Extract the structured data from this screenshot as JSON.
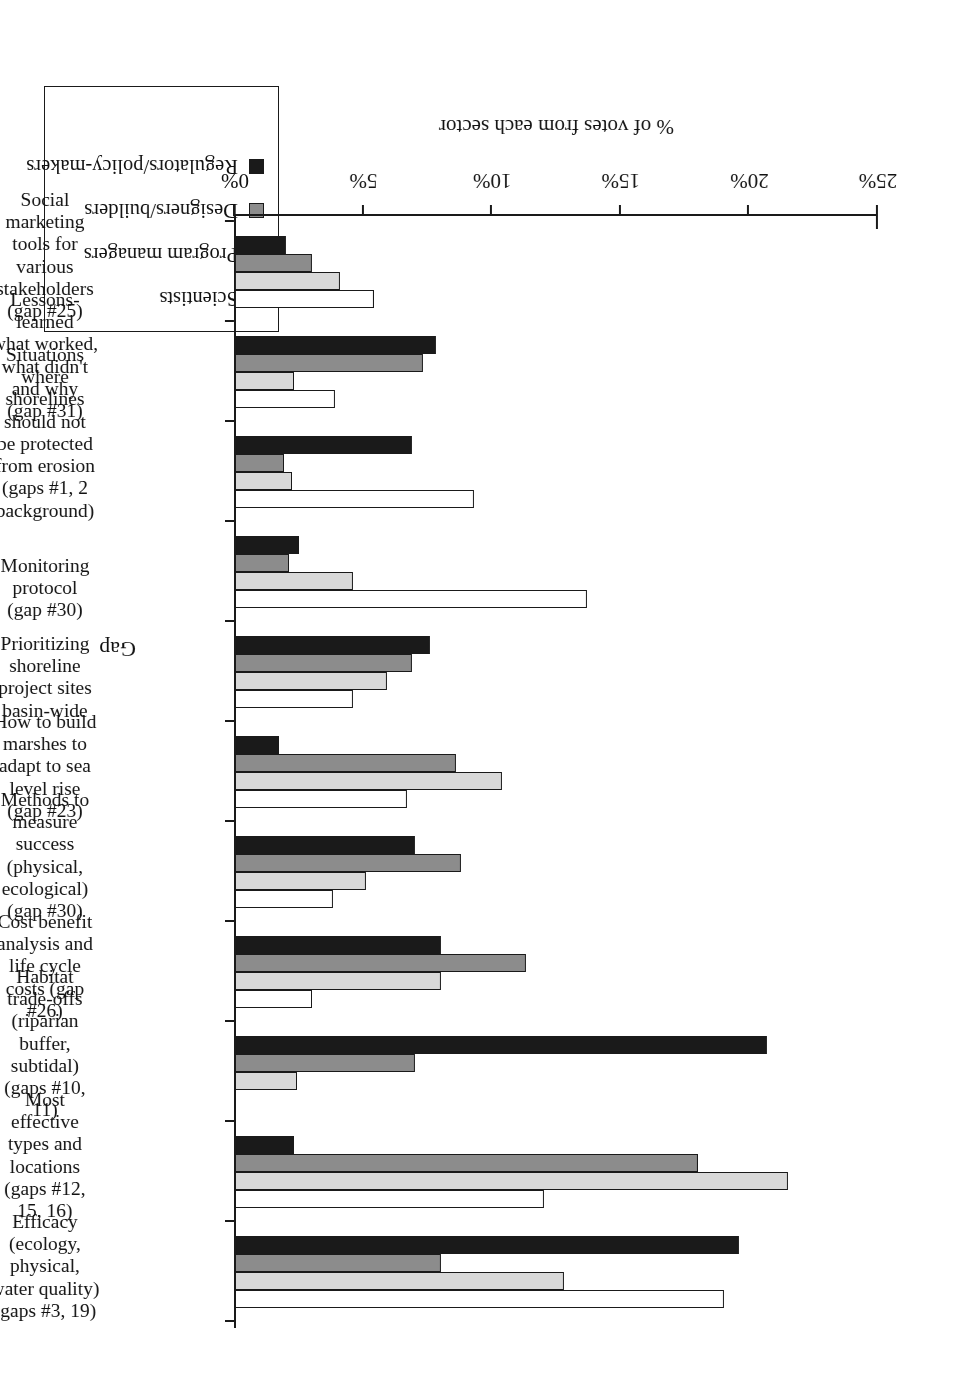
{
  "chart_data": {
    "type": "bar",
    "orientation": "vertical-grouped-rotated-180",
    "title": "",
    "xlabel": "Gap",
    "ylabel": "% of votes from each sector",
    "ylim": [
      0,
      25
    ],
    "yticks": [
      "0%",
      "5%",
      "10%",
      "15%",
      "20%",
      "25%"
    ],
    "ytick_values": [
      0,
      5,
      10,
      15,
      20,
      25
    ],
    "grid": false,
    "legend_position": "top-left",
    "categories": [
      "Efficacy (ecology, physical, water quality) (gaps #3, 19)",
      "Most effective types and locations (gaps #12, 15, 16)",
      "Habitat trade-offs (riparian buffer, subtidal) (gaps #10, 11)",
      "Cost benefit analysis and life cycle costs (gap #26)",
      "Methods to measure success (physical, ecological) (gap #30)",
      "How to build marshes to adapt to sea level rise (gap #23)",
      "Prioritizing shoreline project sites basin-wide",
      "Monitoring protocol (gap #30)",
      "Situations where shorelines should not be protected from erosion (gaps #1, 2 background)",
      "Lessons-learned what worked, what didn't and why (gap #31)",
      "Social marketing tools for various stakeholders (gap #25)"
    ],
    "category_lines": [
      [
        "Efficacy",
        "(ecology,",
        "physical,",
        "water quality)",
        "(gaps #3, 19)"
      ],
      [
        "Most",
        "effective",
        "types and",
        "locations",
        "(gaps #12,",
        "15, 16)"
      ],
      [
        "Habitat",
        "trade-offs",
        "(riparian",
        "buffer,",
        "subtidal)",
        "(gaps #10,",
        "11)"
      ],
      [
        "Cost benefit",
        "analysis and",
        "life cycle",
        "costs (gap",
        "#26)"
      ],
      [
        "Methods to",
        "measure",
        "success",
        "(physical,",
        "ecological)",
        "(gap #30)"
      ],
      [
        "How to build",
        "marshes to",
        "adapt to sea",
        "level rise",
        "(gap #23)"
      ],
      [
        "Prioritizing",
        "shoreline",
        "project sites",
        "basin-wide"
      ],
      [
        "Monitoring",
        "protocol",
        "(gap #30)"
      ],
      [
        "Situations",
        "where",
        "shorelines",
        "should not",
        "be protected",
        "from erosion",
        "(gaps #1, 2",
        "background)"
      ],
      [
        "Lessons-",
        "learned",
        "what worked,",
        "what didn't",
        "and why",
        "(gap #31)"
      ],
      [
        "Social",
        "marketing",
        "tools for",
        "various",
        "stakeholders",
        "(gap #25)"
      ]
    ],
    "series": [
      {
        "name": "Scientists",
        "color": "#ffffff",
        "values": [
          19.0,
          12.0,
          0.0,
          3.0,
          3.8,
          6.7,
          4.6,
          13.7,
          9.3,
          3.9,
          5.4
        ]
      },
      {
        "name": "Program managers",
        "color": "#d9d9d9",
        "values": [
          12.8,
          21.5,
          2.4,
          8.0,
          5.1,
          10.4,
          5.9,
          4.6,
          2.2,
          2.3,
          4.1
        ]
      },
      {
        "name": "Designers/builders",
        "color": "#8c8c8c",
        "values": [
          8.0,
          18.0,
          7.0,
          11.3,
          8.8,
          8.6,
          6.9,
          2.1,
          1.9,
          7.3,
          3.0
        ]
      },
      {
        "name": "Regulators/policy-makers",
        "color": "#1a1a1a",
        "values": [
          19.6,
          2.3,
          20.7,
          8.0,
          7.0,
          1.7,
          7.6,
          2.5,
          6.9,
          7.8,
          2.0
        ]
      }
    ]
  },
  "legend": {
    "items": [
      {
        "label": "Scientists",
        "color": "#ffffff"
      },
      {
        "label": "Program managers",
        "color": "#d9d9d9"
      },
      {
        "label": "Designers/builders",
        "color": "#8c8c8c"
      },
      {
        "label": "Regulators/policy-makers",
        "color": "#1a1a1a"
      }
    ]
  },
  "axes": {
    "value_axis_title": "% of votes from each sector",
    "category_axis_title": "Gap"
  }
}
